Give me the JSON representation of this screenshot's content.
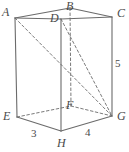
{
  "figure": {
    "type": "geometry-diagram",
    "shape": "rectangular-prism",
    "stroke_color": "#6b6b6b",
    "label_color": "#4a4a4a",
    "background_color": "#ffffff",
    "vertices": [
      {
        "name": "A",
        "label": "A",
        "x": 15,
        "y": 18,
        "hidden": false,
        "label_x": 2,
        "label_y": 6
      },
      {
        "name": "B",
        "label": "B",
        "x": 70,
        "y": 8,
        "hidden": false,
        "label_x": 66,
        "label_y": 0
      },
      {
        "name": "C",
        "label": "C",
        "x": 112,
        "y": 17,
        "hidden": false,
        "label_x": 117,
        "label_y": 7
      },
      {
        "name": "D",
        "label": "D",
        "x": 61,
        "y": 19,
        "hidden": false,
        "label_x": 50,
        "label_y": 12
      },
      {
        "name": "E",
        "label": "E",
        "x": 17,
        "y": 117,
        "hidden": false,
        "label_x": 3,
        "label_y": 110
      },
      {
        "name": "F",
        "label": "F",
        "x": 71,
        "y": 106,
        "hidden": true,
        "label_x": 66,
        "label_y": 99
      },
      {
        "name": "G",
        "label": "G",
        "x": 112,
        "y": 116,
        "hidden": false,
        "label_x": 117,
        "label_y": 110
      },
      {
        "name": "H",
        "label": "H",
        "x": 61,
        "y": 131,
        "hidden": false,
        "label_x": 57,
        "label_y": 137
      }
    ],
    "edge_labels": [
      {
        "name": "edge-EH-length",
        "text": "3",
        "x": 31,
        "y": 128
      },
      {
        "name": "edge-HG-length",
        "text": "4",
        "x": 85,
        "y": 127
      },
      {
        "name": "edge-CG-length",
        "text": "5",
        "x": 115,
        "y": 58
      }
    ],
    "solid_edges": [
      {
        "name": "edge-A-B",
        "from": "A",
        "to": "B"
      },
      {
        "name": "edge-B-C",
        "from": "B",
        "to": "C"
      },
      {
        "name": "edge-A-D",
        "from": "A",
        "to": "D"
      },
      {
        "name": "edge-D-C",
        "from": "D",
        "to": "C"
      },
      {
        "name": "edge-A-E",
        "from": "A",
        "to": "E"
      },
      {
        "name": "edge-D-H",
        "from": "D",
        "to": "H"
      },
      {
        "name": "edge-C-G",
        "from": "C",
        "to": "G"
      },
      {
        "name": "edge-E-H",
        "from": "E",
        "to": "H"
      },
      {
        "name": "edge-H-G",
        "from": "H",
        "to": "G"
      }
    ],
    "dashed_edges": [
      {
        "name": "edge-B-F",
        "from": "B",
        "to": "F"
      },
      {
        "name": "edge-E-F",
        "from": "E",
        "to": "F"
      },
      {
        "name": "edge-F-G",
        "from": "F",
        "to": "G"
      }
    ],
    "dashed_diagonals": [
      {
        "name": "diagonal-A-G",
        "from": "A",
        "to": "G"
      },
      {
        "name": "diagonal-D-G",
        "from": "D",
        "to": "G"
      }
    ]
  }
}
